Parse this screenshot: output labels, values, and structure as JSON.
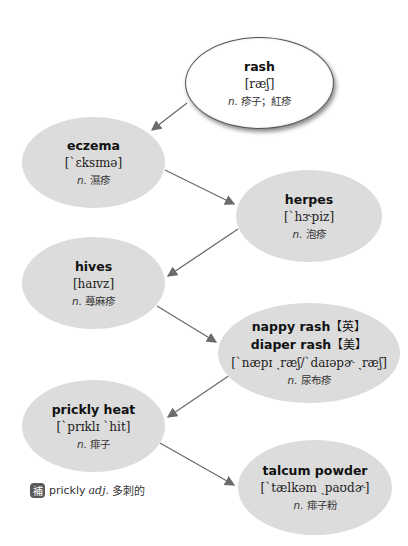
{
  "root": {
    "term": "rash",
    "ipa": "[ræʃ]",
    "pos": "n.",
    "def": "疹子；紅疹"
  },
  "nodes": [
    {
      "term": "eczema",
      "ipa": "[`ɛksɪmə]",
      "pos": "n.",
      "def": "濕疹"
    },
    {
      "term": "herpes",
      "ipa": "[`hɝpiz]",
      "pos": "n.",
      "def": "泡疹"
    },
    {
      "term": "hives",
      "ipa": "[haɪvz]",
      "pos": "n.",
      "def": "蕁麻疹"
    },
    {
      "term": "nappy rash",
      "region": "【英】",
      "term2": "diaper rash",
      "region2": "【美】",
      "ipa": "[`næpɪ ˏræʃ/`daɪəpɚ ˏræʃ]",
      "pos": "n.",
      "def": "尿布疹"
    },
    {
      "term": "prickly heat",
      "ipa": "[`prɪklɪ `hit]",
      "pos": "n.",
      "def": "痱子"
    },
    {
      "term": "talcum powder",
      "ipa": "[`tælkəm ˏpaʊdɚ]",
      "pos": "n.",
      "def": "痱子粉"
    }
  ],
  "note": {
    "badge": "補",
    "word": "prickly",
    "pos": "adj.",
    "def": "多刺的"
  },
  "colors": {
    "node_fill": "#dcdcdc",
    "root_fill": "#ffffff",
    "arrow": "#6b6b6b"
  }
}
